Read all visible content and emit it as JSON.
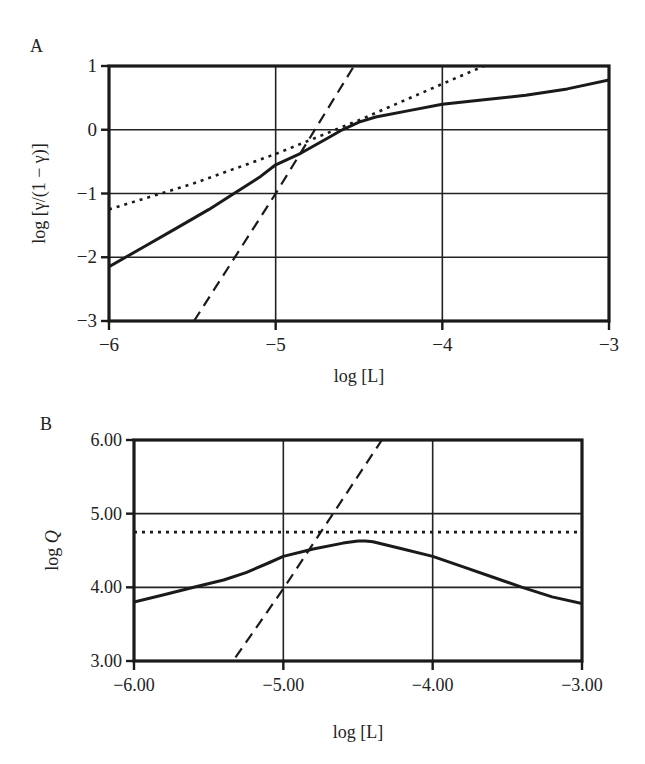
{
  "figure": {
    "panels": [
      "A",
      "B"
    ]
  },
  "chart_data": [
    {
      "panel_label": "A",
      "type": "line",
      "title": "",
      "xlabel": "log [L]",
      "ylabel": "log [γ/(1 − γ)]",
      "xlim": [
        -6,
        -3
      ],
      "ylim": [
        -3,
        1
      ],
      "xticks": [
        -6,
        -5,
        -4,
        -3
      ],
      "xtick_labels": [
        "−6",
        "−5",
        "−4",
        "−3"
      ],
      "yticks": [
        1,
        0,
        -1,
        -2,
        -3
      ],
      "ytick_labels": [
        "1",
        "0",
        "−1",
        "−2",
        "−3"
      ],
      "grid": true,
      "legend": null,
      "series": [
        {
          "name": "solid",
          "style": "solid",
          "x": [
            -6.0,
            -5.8,
            -5.6,
            -5.4,
            -5.25,
            -5.1,
            -5.0,
            -4.85,
            -4.7,
            -4.6,
            -4.5,
            -4.4,
            -4.2,
            -4.0,
            -3.75,
            -3.5,
            -3.25,
            -3.0
          ],
          "y": [
            -2.15,
            -1.85,
            -1.55,
            -1.25,
            -1.0,
            -0.75,
            -0.55,
            -0.37,
            -0.15,
            0.0,
            0.12,
            0.2,
            0.3,
            0.4,
            0.47,
            0.54,
            0.64,
            0.78
          ]
        },
        {
          "name": "dotted",
          "style": "dotted",
          "x": [
            -6.0,
            -5.5,
            -5.0,
            -4.5,
            -4.0,
            -3.75
          ],
          "y": [
            -1.25,
            -0.85,
            -0.38,
            0.15,
            0.72,
            1.0
          ]
        },
        {
          "name": "dashed",
          "style": "dashed",
          "x": [
            -5.49,
            -5.0,
            -4.53
          ],
          "y": [
            -3.0,
            -1.0,
            1.0
          ]
        }
      ]
    },
    {
      "panel_label": "B",
      "type": "line",
      "title": "",
      "xlabel": "log [L]",
      "ylabel": "log Q",
      "xlim": [
        -6,
        -3
      ],
      "ylim": [
        3,
        6
      ],
      "xticks": [
        -6,
        -5,
        -4,
        -3
      ],
      "xtick_labels": [
        "−6.00",
        "−5.00",
        "−4.00",
        "−3.00"
      ],
      "yticks": [
        6,
        5,
        4,
        3
      ],
      "ytick_labels": [
        "6.00",
        "5.00",
        "4.00",
        "3.00"
      ],
      "grid": true,
      "legend": null,
      "series": [
        {
          "name": "solid",
          "style": "solid",
          "x": [
            -6.0,
            -5.8,
            -5.6,
            -5.4,
            -5.25,
            -5.1,
            -5.0,
            -4.8,
            -4.6,
            -4.5,
            -4.45,
            -4.4,
            -4.2,
            -4.0,
            -3.8,
            -3.6,
            -3.4,
            -3.2,
            -3.0
          ],
          "y": [
            3.8,
            3.9,
            4.0,
            4.1,
            4.2,
            4.33,
            4.42,
            4.52,
            4.6,
            4.63,
            4.63,
            4.62,
            4.52,
            4.42,
            4.28,
            4.14,
            4.0,
            3.87,
            3.78
          ]
        },
        {
          "name": "dotted",
          "style": "dotted",
          "x": [
            -6.0,
            -3.0
          ],
          "y": [
            4.75,
            4.75
          ]
        },
        {
          "name": "dashed",
          "style": "dashed",
          "x": [
            -5.32,
            -5.0,
            -4.34
          ],
          "y": [
            3.05,
            3.98,
            6.0
          ]
        }
      ]
    }
  ]
}
